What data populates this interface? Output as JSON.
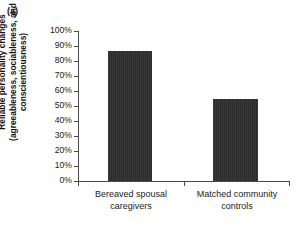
{
  "panel": {
    "label": "(a)"
  },
  "chart_data": {
    "type": "bar",
    "title": "",
    "subtitle": "",
    "xlabel": "",
    "ylabel": "Reliable personality changes (agreeableness, sociableness, and conscientiousness)",
    "ylabel_lines": [
      "Reliable personality changes",
      "(agreeableness, sociableness, and",
      "conscientiousness)"
    ],
    "categories": [
      "Bereaved spousal caregivers",
      "Matched community controls"
    ],
    "category_lines": [
      [
        "Bereaved spousal",
        "caregivers"
      ],
      [
        "Matched community",
        "controls"
      ]
    ],
    "values": [
      87,
      55
    ],
    "value_labels": [
      "87%",
      "55%"
    ],
    "ylim": [
      0,
      100
    ],
    "ytick_values": [
      100,
      90,
      80,
      70,
      60,
      50,
      40,
      30,
      20,
      10,
      0
    ],
    "ytick_labels": [
      "100%",
      "90%",
      "80%",
      "70%",
      "60%",
      "50%",
      "40%",
      "30%",
      "20%",
      "10%",
      "0%"
    ],
    "grid": false,
    "legend": null,
    "legend_position": "none",
    "bar_color": "#333333",
    "axis_color": "#4a4a4a",
    "background_color": "#ffffff"
  }
}
